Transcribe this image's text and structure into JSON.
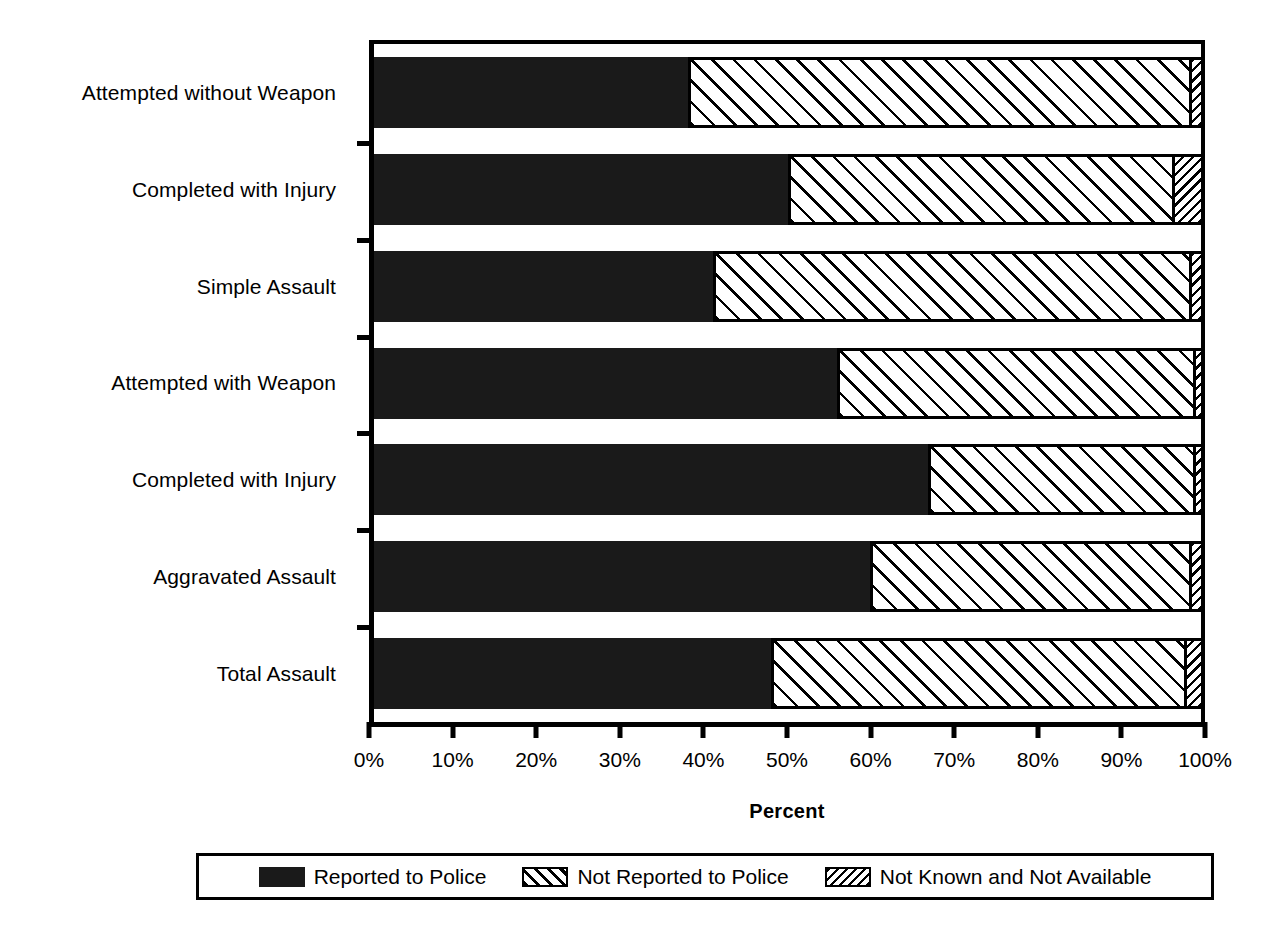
{
  "chart_data": {
    "type": "bar",
    "orientation": "horizontal",
    "stacked": true,
    "stack_mode": "percent",
    "title": "",
    "xlabel": "Percent",
    "ylabel": "",
    "xlim": [
      0,
      100
    ],
    "grid": false,
    "legend_position": "bottom",
    "xticks": [
      0,
      10,
      20,
      30,
      40,
      50,
      60,
      70,
      80,
      90,
      100
    ],
    "xticklabels": [
      "0%",
      "10%",
      "20%",
      "30%",
      "40%",
      "50%",
      "60%",
      "70%",
      "80%",
      "90%",
      "100%"
    ],
    "categories": [
      "Attempted without Weapon",
      "Completed with Injury",
      "Simple Assault",
      "Attempted with Weapon",
      "Completed with Injury",
      "Aggravated Assault",
      "Total Assault"
    ],
    "series": [
      {
        "name": "Reported to Police",
        "pattern": "solid-black",
        "values": [
          38,
          50,
          41,
          56,
          67,
          60,
          48
        ]
      },
      {
        "name": "Not Reported to Police",
        "pattern": "sparse-forward-hatch",
        "values": [
          60.5,
          46.5,
          57.5,
          43,
          32,
          38.5,
          50
        ]
      },
      {
        "name": "Not Known and Not Available",
        "pattern": "dense-back-hatch",
        "values": [
          1.5,
          3.5,
          1.5,
          1,
          1,
          1.5,
          2
        ]
      }
    ]
  },
  "axis": {
    "x_title": "Percent"
  },
  "legend": {
    "entries": [
      {
        "label": "Reported to Police",
        "swatch": "solid-black-swatch"
      },
      {
        "label": "Not Reported to Police",
        "swatch": "sparse-hatch-swatch"
      },
      {
        "label": "Not Known and Not Available",
        "swatch": "dense-hatch-swatch"
      }
    ]
  }
}
